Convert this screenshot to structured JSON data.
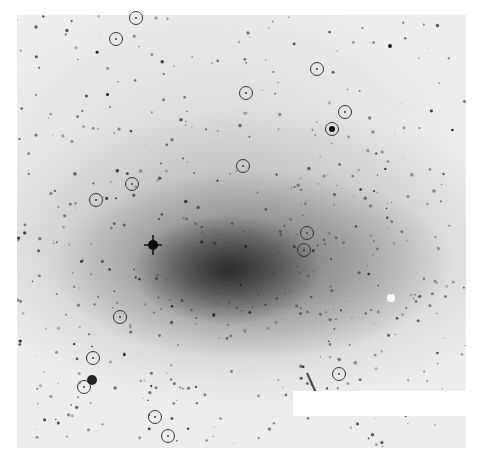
{
  "image": {
    "description": "Negative (inverted grayscale) astronomical image of a spiral galaxy with circled sources",
    "frame": {
      "x": 17,
      "y": 15,
      "width": 449,
      "height": 433
    },
    "mask_rect": {
      "x": 293,
      "y": 391,
      "width": 173,
      "height": 25
    },
    "bright_features": [
      {
        "name": "galaxy-core",
        "x": 227,
        "y": 272
      },
      {
        "name": "foreground-star-spike",
        "x": 153,
        "y": 245
      },
      {
        "name": "white-saturated-star",
        "x": 391,
        "y": 298
      },
      {
        "name": "star-cluster",
        "x": 92,
        "y": 380
      }
    ]
  },
  "markers": [
    {
      "id": 1,
      "x": 136,
      "y": 18
    },
    {
      "id": 2,
      "x": 116,
      "y": 39
    },
    {
      "id": 3,
      "x": 317,
      "y": 69
    },
    {
      "id": 4,
      "x": 246,
      "y": 93
    },
    {
      "id": 5,
      "x": 345,
      "y": 112
    },
    {
      "id": 6,
      "x": 332,
      "y": 129
    },
    {
      "id": 7,
      "x": 243,
      "y": 166
    },
    {
      "id": 8,
      "x": 132,
      "y": 184
    },
    {
      "id": 9,
      "x": 96,
      "y": 200
    },
    {
      "id": 10,
      "x": 307,
      "y": 233
    },
    {
      "id": 11,
      "x": 304,
      "y": 250
    },
    {
      "id": 12,
      "x": 120,
      "y": 317
    },
    {
      "id": 13,
      "x": 93,
      "y": 358
    },
    {
      "id": 14,
      "x": 84,
      "y": 387
    },
    {
      "id": 15,
      "x": 339,
      "y": 374
    },
    {
      "id": 16,
      "x": 155,
      "y": 417
    },
    {
      "id": 17,
      "x": 168,
      "y": 436
    }
  ],
  "colors": {
    "background": "#ffffff",
    "sky": "#ededed",
    "marker": "#333333"
  }
}
